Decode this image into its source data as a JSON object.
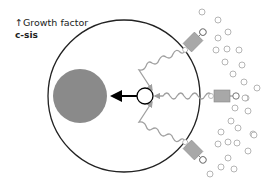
{
  "labels": {
    "arrow_symbol": "↑",
    "line1": "Growth factor",
    "line2": "c-sis"
  },
  "diagram": {
    "cell": {
      "cx": 124,
      "cy": 96,
      "r": 76,
      "stroke": "#222222"
    },
    "nucleus": {
      "cx": 80,
      "cy": 96,
      "r": 27,
      "fill": "#8a8a8a"
    },
    "hub": {
      "cx": 145,
      "cy": 96,
      "r": 8
    },
    "receptor_color": "#a8a8a8",
    "signal_color": "#a0a0a0",
    "ligand_color": "#b5b5b5",
    "receptors": [
      {
        "x": 193,
        "y": 42,
        "angle": -45
      },
      {
        "x": 222,
        "y": 96,
        "angle": 0
      },
      {
        "x": 193,
        "y": 150,
        "angle": 45
      }
    ],
    "ligands": [
      [
        202,
        12
      ],
      [
        218,
        20
      ],
      [
        228,
        32
      ],
      [
        218,
        38
      ],
      [
        216,
        50
      ],
      [
        227,
        49
      ],
      [
        239,
        50
      ],
      [
        225,
        62
      ],
      [
        242,
        65
      ],
      [
        233,
        74
      ],
      [
        244,
        82
      ],
      [
        257,
        88
      ],
      [
        246,
        98
      ],
      [
        245,
        98
      ],
      [
        235,
        108
      ],
      [
        248,
        111
      ],
      [
        231,
        121
      ],
      [
        238,
        128
      ],
      [
        221,
        132
      ],
      [
        253,
        134
      ],
      [
        218,
        144
      ],
      [
        228,
        142
      ],
      [
        237,
        143
      ],
      [
        248,
        151
      ],
      [
        228,
        158
      ],
      [
        221,
        167
      ],
      [
        234,
        169
      ],
      [
        210,
        174
      ],
      [
        254,
        135
      ]
    ]
  }
}
